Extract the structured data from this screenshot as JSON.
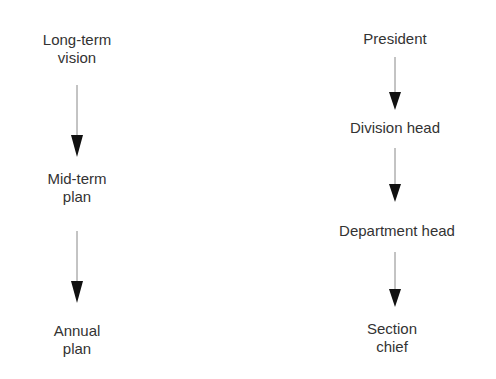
{
  "left_column": {
    "nodes": [
      {
        "line1": "Long-term",
        "line2": "vision"
      },
      {
        "line1": "Mid-term",
        "line2": "plan"
      },
      {
        "line1": "Annual",
        "line2": "plan"
      }
    ]
  },
  "right_column": {
    "nodes": [
      {
        "line1": "President"
      },
      {
        "line1": "Division head"
      },
      {
        "line1": "Department head"
      },
      {
        "line1": "Section",
        "line2": "chief"
      }
    ]
  },
  "colors": {
    "text": "#333333",
    "arrow": "#111111",
    "line": "#888888"
  }
}
